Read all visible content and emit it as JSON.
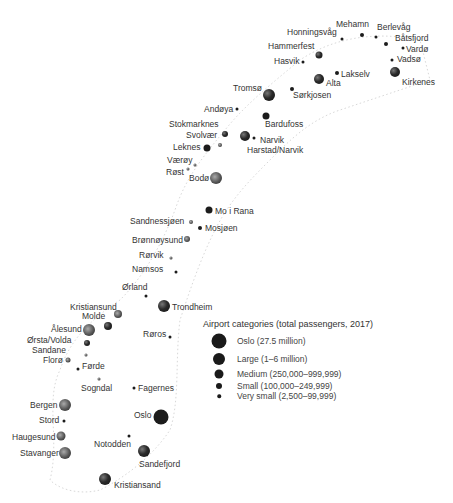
{
  "map": {
    "title": "Norwegian airports",
    "legend": {
      "title": "Airport categories (total passengers, 2017)",
      "items": [
        {
          "label": "Oslo (27.5 million)",
          "size": 15
        },
        {
          "label": "Large (1–6 million)",
          "size": 12
        },
        {
          "label": "Medium (250,000–999,999)",
          "size": 9
        },
        {
          "label": "Small (100,000–249,999)",
          "size": 6
        },
        {
          "label": "Very small (2,500–99,999)",
          "size": 3.5
        }
      ]
    },
    "airports": [
      {
        "name": "Mehamn",
        "category": "small"
      },
      {
        "name": "Berlevåg",
        "category": "very small"
      },
      {
        "name": "Honningsvåg",
        "category": "very small"
      },
      {
        "name": "Båtsfjord",
        "category": "small"
      },
      {
        "name": "Hammerfest",
        "category": "medium"
      },
      {
        "name": "Vardø",
        "category": "very small"
      },
      {
        "name": "Hasvik",
        "category": "very small"
      },
      {
        "name": "Vadsø",
        "category": "very small"
      },
      {
        "name": "Lakselv",
        "category": "very small"
      },
      {
        "name": "Alta",
        "category": "large"
      },
      {
        "name": "Kirkenes",
        "category": "large"
      },
      {
        "name": "Tromsø",
        "category": "large"
      },
      {
        "name": "Sørkjosen",
        "category": "very small"
      },
      {
        "name": "Andøya",
        "category": "very small"
      },
      {
        "name": "Bardufoss",
        "category": "medium"
      },
      {
        "name": "Stokmarknes",
        "category": "medium"
      },
      {
        "name": "Svolvær",
        "category": "very small"
      },
      {
        "name": "Narvik",
        "category": "very small"
      },
      {
        "name": "Harstad/Narvik",
        "category": "large"
      },
      {
        "name": "Leknes",
        "category": "medium"
      },
      {
        "name": "Værøy",
        "category": "very small"
      },
      {
        "name": "Røst",
        "category": "very small"
      },
      {
        "name": "Bodø",
        "category": "large"
      },
      {
        "name": "Mo i Rana",
        "category": "medium"
      },
      {
        "name": "Sandnessjøen",
        "category": "small"
      },
      {
        "name": "Mosjøen",
        "category": "small"
      },
      {
        "name": "Brønnøysund",
        "category": "medium"
      },
      {
        "name": "Rørvik",
        "category": "very small"
      },
      {
        "name": "Namsos",
        "category": "very small"
      },
      {
        "name": "Ørland",
        "category": "very small"
      },
      {
        "name": "Trondheim",
        "category": "large"
      },
      {
        "name": "Kristiansund",
        "category": "medium"
      },
      {
        "name": "Molde",
        "category": "medium"
      },
      {
        "name": "Ålesund",
        "category": "large"
      },
      {
        "name": "Ørsta/Volda",
        "category": "medium"
      },
      {
        "name": "Røros",
        "category": "very small"
      },
      {
        "name": "Sandane",
        "category": "very small"
      },
      {
        "name": "Florø",
        "category": "medium"
      },
      {
        "name": "Førde",
        "category": "very small"
      },
      {
        "name": "Sogndal",
        "category": "very small"
      },
      {
        "name": "Fagernes",
        "category": "very small"
      },
      {
        "name": "Bergen",
        "category": "large"
      },
      {
        "name": "Oslo",
        "category": "oslo"
      },
      {
        "name": "Stord",
        "category": "very small"
      },
      {
        "name": "Haugesund",
        "category": "large"
      },
      {
        "name": "Notodden",
        "category": "very small"
      },
      {
        "name": "Stavanger",
        "category": "large"
      },
      {
        "name": "Sandefjord",
        "category": "large"
      },
      {
        "name": "Kristiansand",
        "category": "large"
      }
    ]
  }
}
